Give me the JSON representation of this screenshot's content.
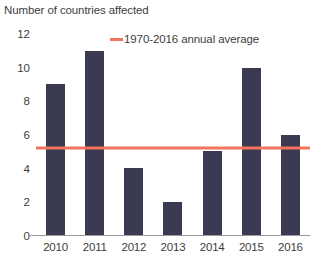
{
  "chart_data": {
    "type": "bar",
    "title": "Number of countries affected",
    "xlabel": "",
    "ylabel": "",
    "categories": [
      "2010",
      "2011",
      "2012",
      "2013",
      "2014",
      "2015",
      "2016"
    ],
    "values": [
      9,
      11,
      4,
      2,
      5,
      10,
      6
    ],
    "ylim": [
      0,
      12
    ],
    "ytick_labels": [
      "12",
      "10",
      "8",
      "6",
      "4",
      "2",
      "0"
    ],
    "ytick_values": [
      12,
      10,
      8,
      6,
      4,
      2,
      0
    ],
    "grid": false,
    "legend_position": "top-center",
    "series": [
      {
        "name": "Number of countries affected",
        "type": "bar",
        "values": [
          9,
          11,
          4,
          2,
          5,
          10,
          6
        ],
        "color": "#3a3a52"
      },
      {
        "name": "1970-2016 annual average",
        "type": "reference-line",
        "value": 5.2,
        "color": "#f4735c"
      }
    ],
    "legend": [
      {
        "label": "1970-2016 annual average",
        "color": "#f4735c",
        "marker": "line"
      }
    ],
    "colors": {
      "bar": "#3a3a52",
      "average_line": "#f4735c",
      "axis": "#9a9a9a",
      "text": "#3d3d3d",
      "background": "#ffffff"
    }
  }
}
